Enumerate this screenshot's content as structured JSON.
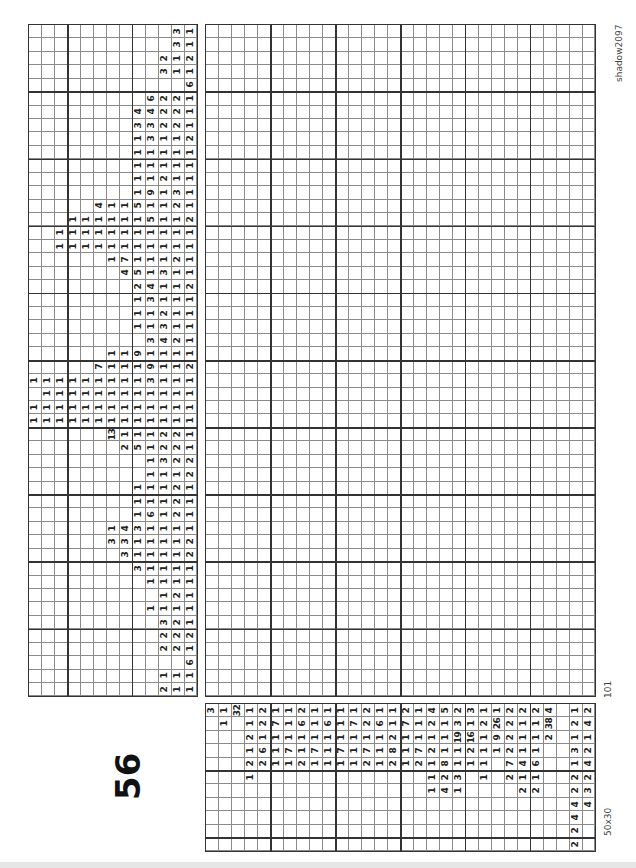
{
  "puzzle": {
    "number": "56",
    "author": "shadow2097",
    "id": "101",
    "size": "50x30"
  },
  "layout": {
    "column_clue_block": {
      "x": 28,
      "y": 24,
      "w": 170,
      "h": 673,
      "cols": 13,
      "rows": 50
    },
    "grid": {
      "x": 205,
      "y": 24,
      "w": 391,
      "h": 673,
      "cols": 30,
      "rows": 50
    },
    "row_clue_block": {
      "x": 205,
      "y": 703,
      "w": 391,
      "h": 149,
      "cols": 30,
      "rows": 11
    },
    "line_color": "#8a8a8a",
    "heavy_line_color": "#333333"
  },
  "column_clues": [
    [
      3,
      1
    ],
    [
      3,
      1
    ],
    [
      2,
      1,
      2
    ],
    [
      3,
      1,
      1
    ],
    [
      6
    ],
    [
      6,
      2,
      2,
      1
    ],
    [
      4,
      4,
      2,
      2,
      1
    ],
    [
      3,
      3,
      2,
      2,
      1
    ],
    [
      1,
      3,
      1,
      1,
      2
    ],
    [
      1,
      1,
      1,
      1,
      1
    ],
    [
      1,
      1,
      1,
      1,
      1
    ],
    [
      1,
      1,
      2,
      1,
      1
    ],
    [
      1,
      9,
      1,
      3,
      1
    ],
    [
      4,
      1,
      1,
      5,
      1,
      1,
      2,
      1
    ],
    [
      1,
      1,
      1,
      1,
      1,
      1,
      5,
      1,
      1,
      2
    ],
    [
      1,
      1,
      1,
      1,
      1,
      1,
      1,
      1,
      1,
      1,
      1
    ],
    [
      1,
      1,
      1,
      1,
      1,
      1,
      1,
      1,
      1,
      1,
      1
    ],
    [
      1,
      7,
      1,
      1,
      1,
      2,
      1
    ],
    [
      4,
      5,
      1,
      3,
      1,
      1
    ],
    [
      2,
      4,
      1,
      1,
      2
    ],
    [
      1,
      3,
      1,
      1,
      1
    ],
    [
      1,
      1,
      2,
      1,
      1
    ],
    [
      1,
      1,
      3,
      1,
      1
    ],
    [
      3,
      4,
      2,
      1
    ],
    [
      1,
      1,
      9,
      1,
      1,
      1,
      1
    ],
    [
      7,
      1,
      1,
      1,
      9,
      1,
      1,
      2
    ],
    [
      1,
      1,
      1,
      1,
      1,
      1,
      1,
      1,
      1,
      3,
      1,
      1,
      1
    ],
    [
      1,
      1,
      1,
      1,
      1,
      1,
      1,
      1,
      1,
      1,
      1,
      1
    ],
    [
      1,
      1,
      1,
      1,
      1,
      1,
      1,
      1,
      1,
      1,
      1,
      1,
      1
    ],
    [
      1,
      1,
      1,
      1,
      1,
      1,
      1,
      1,
      1,
      1,
      1,
      1,
      1
    ],
    [
      13,
      1,
      1,
      1,
      2,
      2,
      1
    ],
    [
      2,
      5,
      1,
      2,
      2,
      1
    ],
    [
      1,
      3,
      2,
      2
    ],
    [
      1,
      1,
      1,
      2
    ],
    [
      1,
      1,
      1,
      2,
      1
    ],
    [
      1,
      1,
      1,
      2,
      1
    ],
    [
      1,
      6,
      1,
      2,
      1
    ],
    [
      1,
      4,
      3,
      1,
      1,
      1,
      1
    ],
    [
      3,
      3,
      1,
      1,
      1,
      1,
      2
    ],
    [
      3,
      1,
      1,
      1,
      1,
      2
    ],
    [
      3,
      1,
      1,
      1,
      1
    ],
    [
      1,
      1,
      1,
      1
    ],
    [
      1,
      2,
      1
    ],
    [
      1,
      1,
      1,
      1
    ],
    [
      3,
      2,
      1
    ],
    [
      2,
      2,
      2
    ],
    [
      2,
      2,
      1
    ],
    [
      6
    ],
    [
      1,
      1,
      1
    ],
    [
      2,
      1,
      1
    ]
  ],
  "row_clues": [
    [
      3
    ],
    [
      1,
      1
    ],
    [
      32
    ],
    [
      1,
      1,
      2,
      1,
      2,
      1
    ],
    [
      2,
      2,
      1,
      6,
      2
    ],
    [
      1,
      7,
      1,
      1,
      1
    ],
    [
      1,
      1,
      1,
      7,
      1
    ],
    [
      2,
      6,
      1,
      1,
      2
    ],
    [
      1,
      1,
      1,
      7,
      1
    ],
    [
      1,
      6,
      1,
      1,
      1
    ],
    [
      1,
      1,
      1,
      7,
      1
    ],
    [
      1,
      7,
      1,
      1,
      1
    ],
    [
      2,
      2,
      1,
      7,
      2
    ],
    [
      1,
      6,
      1,
      1,
      1
    ],
    [
      1,
      1,
      2,
      8,
      2
    ],
    [
      2,
      7,
      1,
      1,
      1
    ],
    [
      1,
      1,
      1,
      7,
      2
    ],
    [
      4,
      2,
      1,
      2,
      1,
      1,
      1
    ],
    [
      5,
      1,
      1,
      1,
      8,
      2,
      4
    ],
    [
      2,
      3,
      19,
      1,
      1,
      3,
      1
    ],
    [
      3,
      1,
      16,
      2,
      1
    ],
    [
      1,
      2,
      1,
      1,
      1,
      1
    ],
    [
      1,
      26,
      9,
      1
    ],
    [
      2,
      2,
      2,
      2,
      7,
      2
    ],
    [
      2,
      1,
      1,
      1,
      4,
      1,
      2
    ],
    [
      2,
      1,
      1,
      1,
      6,
      1,
      2
    ],
    [
      4,
      38,
      2
    ],
    [],
    [
      1,
      2,
      1,
      3,
      1,
      2,
      2,
      4,
      4,
      2,
      2
    ],
    [
      2,
      4,
      1,
      2,
      4,
      2,
      3,
      4
    ]
  ]
}
